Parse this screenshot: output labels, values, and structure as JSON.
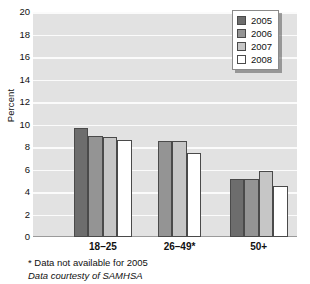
{
  "chart_data": {
    "type": "bar",
    "title": "",
    "xlabel": "",
    "ylabel": "Percent",
    "ylim": [
      0,
      20
    ],
    "ytick_step": 2,
    "yticks": [
      20,
      18,
      16,
      14,
      12,
      10,
      8,
      6,
      4,
      2,
      0
    ],
    "grid": true,
    "grid_axis": "y",
    "legend_position": "top-right",
    "categories": [
      "18–25",
      "26–49*",
      "50+"
    ],
    "series": [
      {
        "name": "2005",
        "color": "#6d6d6d",
        "values": [
          9.7,
          null,
          5.15
        ]
      },
      {
        "name": "2006",
        "color": "#949494",
        "values": [
          9.0,
          8.5,
          5.15
        ]
      },
      {
        "name": "2007",
        "color": "#c6c6c6",
        "values": [
          8.85,
          8.5,
          5.85
        ]
      },
      {
        "name": "2008",
        "color": "#ffffff",
        "values": [
          8.6,
          7.45,
          4.5
        ]
      }
    ],
    "annotations": [
      "* Data not available for 2005",
      "Data courtesty of SAMHSA"
    ]
  },
  "legend": {
    "entries": [
      {
        "label": "2005",
        "color": "#6d6d6d"
      },
      {
        "label": "2006",
        "color": "#949494"
      },
      {
        "label": "2007",
        "color": "#c6c6c6"
      },
      {
        "label": "2008",
        "color": "#ffffff"
      }
    ]
  },
  "notes": {
    "footnote": "* Data not available for 2005",
    "source": "Data courtesty of SAMHSA"
  },
  "colors": {
    "plot_background": "#e2e2e2",
    "gridline": "#fbfbfb",
    "bar_outline": "#4a4a4a",
    "text": "#111111"
  }
}
